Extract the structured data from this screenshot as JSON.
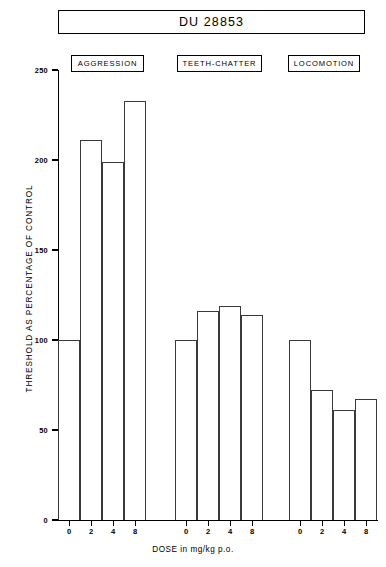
{
  "chart_data": {
    "type": "bar",
    "title": "DU 28853",
    "xlabel": "DOSE in mg/kg p.o.",
    "ylabel": "THRESHOLD AS PERCENTAGE OF CONTROL",
    "ylim": [
      0,
      250
    ],
    "ytick_labels": [
      "0",
      "50",
      "100",
      "150",
      "200",
      "250"
    ],
    "yticks": [
      0,
      50,
      100,
      150,
      200,
      250
    ],
    "grid": false,
    "legend": "none",
    "categories": [
      "0",
      "2",
      "4",
      "8"
    ],
    "groups": [
      {
        "name": "AGGRESSION",
        "doses": [
          "0",
          "2",
          "4",
          "8"
        ],
        "values": [
          100,
          211,
          199,
          233
        ]
      },
      {
        "name": "TEETH-CHATTER",
        "doses": [
          "0",
          "2",
          "4",
          "8"
        ],
        "values": [
          100,
          116,
          119,
          114
        ]
      },
      {
        "name": "LOCOMOTION",
        "doses": [
          "0",
          "2",
          "4",
          "8"
        ],
        "values": [
          100,
          72,
          61,
          67
        ]
      }
    ],
    "series": [
      {
        "name": "AGGRESSION",
        "values": [
          100,
          211,
          199,
          233
        ]
      },
      {
        "name": "TEETH-CHATTER",
        "values": [
          100,
          116,
          119,
          114
        ]
      },
      {
        "name": "LOCOMOTION",
        "values": [
          100,
          72,
          61,
          67
        ]
      }
    ],
    "colors": {
      "bar_outline": "#3a3a3a",
      "bar_fill": "#ffffff",
      "axis": "#000000",
      "text": "#000000"
    }
  }
}
